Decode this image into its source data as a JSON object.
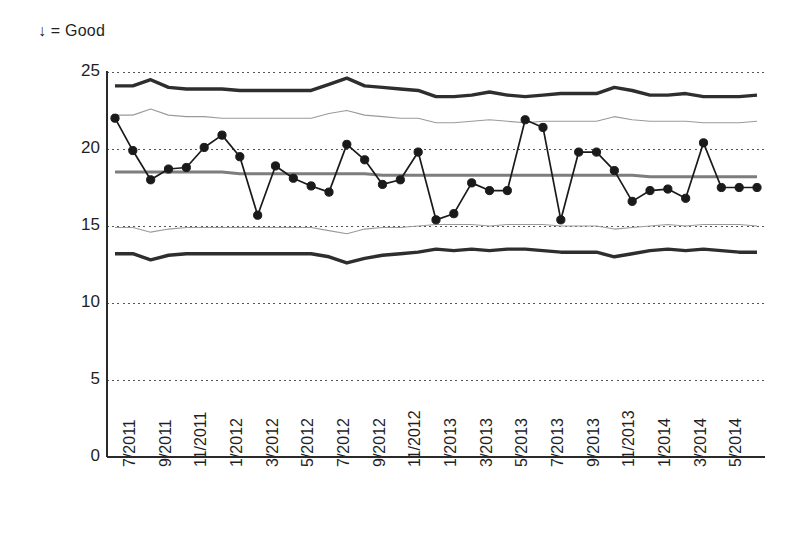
{
  "annotation": {
    "good_direction": "↓ = Good"
  },
  "axes": {
    "y_label": "Rate",
    "y_ticks": [
      0,
      5,
      10,
      15,
      20,
      25
    ],
    "y_min": 0,
    "y_max": 25,
    "x_tick_labels": [
      "7/2011",
      "9/2011",
      "11/2011",
      "1/2012",
      "3/2012",
      "5/2012",
      "7/2012",
      "9/2012",
      "11/2012",
      "1/2013",
      "3/2013",
      "5/2013",
      "7/2013",
      "9/2013",
      "11/2013",
      "1/2014",
      "3/2014",
      "5/2014"
    ],
    "x_tick_every": 2,
    "grid": "horizontal-dotted"
  },
  "colors": {
    "series": "#1a1a1a",
    "control_limit": "#2e2e2e",
    "warning_limit": "#9a9a9a",
    "center_line": "#7d7d7d",
    "gridline": "#55555a",
    "axis": "#2a2a2a",
    "text": "#1f1f1f"
  },
  "chart_data": {
    "type": "line",
    "title": "↓ = Good",
    "xlabel": "",
    "ylabel": "Rate",
    "ylim": [
      0,
      25
    ],
    "grid": true,
    "legend": "none",
    "x": [
      "7/2011",
      "8/2011",
      "9/2011",
      "10/2011",
      "11/2011",
      "12/2011",
      "1/2012",
      "2/2012",
      "3/2012",
      "4/2012",
      "5/2012",
      "6/2012",
      "7/2012",
      "8/2012",
      "9/2012",
      "10/2012",
      "11/2012",
      "12/2012",
      "1/2013",
      "2/2013",
      "3/2013",
      "4/2013",
      "5/2013",
      "6/2013",
      "7/2013",
      "8/2013",
      "9/2013",
      "10/2013",
      "11/2013",
      "12/2013",
      "1/2014",
      "2/2014",
      "3/2014",
      "4/2014",
      "5/2014",
      "6/2014",
      "7/2014"
    ],
    "series": [
      {
        "name": "Rate",
        "style": "line-with-markers",
        "values": [
          22.0,
          19.9,
          18.0,
          18.7,
          18.8,
          20.1,
          20.9,
          19.5,
          15.7,
          18.9,
          18.1,
          17.6,
          17.2,
          20.3,
          19.3,
          17.7,
          18.0,
          19.8,
          15.4,
          15.8,
          17.8,
          17.3,
          17.3,
          21.9,
          21.4,
          15.4,
          19.8,
          19.8,
          18.6,
          16.6,
          17.3,
          17.4,
          16.8,
          20.4,
          17.5,
          17.5,
          17.5
        ]
      },
      {
        "name": "Upper control limit",
        "style": "thick-line",
        "values": [
          24.1,
          24.1,
          24.5,
          24.0,
          23.9,
          23.9,
          23.9,
          23.8,
          23.8,
          23.8,
          23.8,
          23.8,
          24.2,
          24.6,
          24.1,
          24.0,
          23.9,
          23.8,
          23.4,
          23.4,
          23.5,
          23.7,
          23.5,
          23.4,
          23.5,
          23.6,
          23.6,
          23.6,
          24.0,
          23.8,
          23.5,
          23.5,
          23.6,
          23.4,
          23.4,
          23.4,
          23.5
        ]
      },
      {
        "name": "Upper warning limit",
        "style": "thin-line",
        "values": [
          22.2,
          22.2,
          22.6,
          22.2,
          22.1,
          22.1,
          22.0,
          22.0,
          22.0,
          22.0,
          22.0,
          22.0,
          22.3,
          22.5,
          22.2,
          22.1,
          22.0,
          22.0,
          21.7,
          21.7,
          21.8,
          21.9,
          21.8,
          21.7,
          21.8,
          21.8,
          21.8,
          21.8,
          22.1,
          21.9,
          21.8,
          21.8,
          21.8,
          21.7,
          21.7,
          21.7,
          21.8
        ]
      },
      {
        "name": "Center line",
        "style": "center-line",
        "values": [
          18.5,
          18.5,
          18.5,
          18.5,
          18.5,
          18.5,
          18.5,
          18.4,
          18.4,
          18.4,
          18.4,
          18.4,
          18.4,
          18.4,
          18.4,
          18.3,
          18.3,
          18.3,
          18.3,
          18.3,
          18.3,
          18.3,
          18.3,
          18.3,
          18.3,
          18.3,
          18.3,
          18.3,
          18.3,
          18.3,
          18.2,
          18.2,
          18.2,
          18.2,
          18.2,
          18.2,
          18.2
        ]
      },
      {
        "name": "Lower warning limit",
        "style": "thin-line",
        "values": [
          14.9,
          14.9,
          14.6,
          14.8,
          14.9,
          14.9,
          14.9,
          14.9,
          14.9,
          14.9,
          14.9,
          14.9,
          14.7,
          14.5,
          14.8,
          14.9,
          14.9,
          15.0,
          15.1,
          15.1,
          15.1,
          15.0,
          15.1,
          15.1,
          15.1,
          15.0,
          15.0,
          15.0,
          14.8,
          14.9,
          15.0,
          15.1,
          15.0,
          15.1,
          15.1,
          15.1,
          15.0
        ]
      },
      {
        "name": "Lower control limit",
        "style": "thick-line",
        "values": [
          13.2,
          13.2,
          12.8,
          13.1,
          13.2,
          13.2,
          13.2,
          13.2,
          13.2,
          13.2,
          13.2,
          13.2,
          13.0,
          12.6,
          12.9,
          13.1,
          13.2,
          13.3,
          13.5,
          13.4,
          13.5,
          13.4,
          13.5,
          13.5,
          13.4,
          13.3,
          13.3,
          13.3,
          13.0,
          13.2,
          13.4,
          13.5,
          13.4,
          13.5,
          13.4,
          13.3,
          13.3
        ]
      }
    ],
    "annotations": [
      {
        "text": "↓ = Good",
        "position": "top-left"
      }
    ]
  }
}
